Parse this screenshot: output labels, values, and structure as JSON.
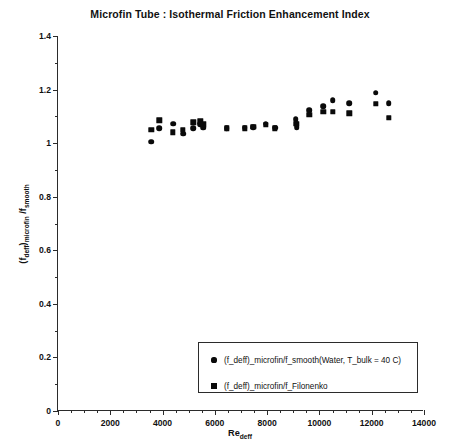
{
  "chart_data": {
    "type": "scatter",
    "title": "Microfin Tube : Isothermal Friction Enhancement Index",
    "xlabel": "Re_deff",
    "ylabel": "(f_deff)_microfin / f_smooth",
    "xlim": [
      0,
      14000
    ],
    "ylim": [
      0,
      1.4
    ],
    "xticks": [
      0,
      2000,
      4000,
      6000,
      8000,
      10000,
      12000,
      14000
    ],
    "yticks": [
      0,
      0.2,
      0.4,
      0.6,
      0.8,
      1,
      1.2,
      1.4
    ],
    "xtick_labels": [
      "0",
      "2000",
      "4000",
      "6000",
      "8000",
      "10000",
      "12000",
      "14000"
    ],
    "ytick_labels": [
      "0",
      "0.2",
      "0.4",
      "0.6",
      "0.8",
      "1",
      "1.2",
      "1.4"
    ],
    "minor_ticks": true,
    "grid": false,
    "legend_position": "bottom-right",
    "series": [
      {
        "name": "(f_deff)_microfin/f_smooth(Water, T_bulk = 40 C)",
        "marker": "circle",
        "color": "#0a0a0a",
        "points": [
          [
            3570,
            1.005
          ],
          [
            3880,
            1.055
          ],
          [
            4400,
            1.072
          ],
          [
            4780,
            1.035
          ],
          [
            5180,
            1.055
          ],
          [
            5450,
            1.07
          ],
          [
            5560,
            1.058
          ],
          [
            6450,
            1.055
          ],
          [
            7140,
            1.057
          ],
          [
            7470,
            1.06
          ],
          [
            7950,
            1.073
          ],
          [
            8300,
            1.058
          ],
          [
            9100,
            1.09
          ],
          [
            9130,
            1.06
          ],
          [
            9620,
            1.122
          ],
          [
            10150,
            1.138
          ],
          [
            10500,
            1.16
          ],
          [
            11150,
            1.15
          ],
          [
            12150,
            1.188
          ],
          [
            12650,
            1.15
          ]
        ]
      },
      {
        "name": "(f_deff)_microfin/f_Filonenko",
        "marker": "square",
        "color": "#0a0a0a",
        "points": [
          [
            3570,
            1.05
          ],
          [
            3880,
            1.085
          ],
          [
            4400,
            1.04
          ],
          [
            4780,
            1.05
          ],
          [
            5180,
            1.078
          ],
          [
            5450,
            1.082
          ],
          [
            5560,
            1.07
          ],
          [
            6450,
            1.055
          ],
          [
            7140,
            1.055
          ],
          [
            7470,
            1.06
          ],
          [
            7950,
            1.068
          ],
          [
            8300,
            1.055
          ],
          [
            9100,
            1.072
          ],
          [
            9130,
            1.072
          ],
          [
            9620,
            1.105
          ],
          [
            10150,
            1.118
          ],
          [
            10500,
            1.118
          ],
          [
            11150,
            1.112
          ],
          [
            12150,
            1.148
          ],
          [
            12650,
            1.095
          ]
        ]
      }
    ]
  },
  "legend": {
    "entries": [
      {
        "marker": "circle",
        "label": "(f_deff)_microfin/f_smooth(Water, T_bulk = 40 C)"
      },
      {
        "marker": "square",
        "label": "(f_deff)_microfin/f_Filonenko"
      }
    ]
  },
  "axis_titles": {
    "y_main": "(f",
    "y_sub1": "deff",
    "y_mid": ")",
    "y_sub2": "microfin",
    "y_tail": " /f",
    "y_sub3": "smooth",
    "x_main": "Re",
    "x_sub": "deff"
  }
}
